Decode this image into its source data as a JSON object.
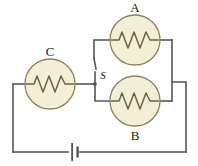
{
  "figure": {
    "kind": "circuit-diagram",
    "background_color": "#ffffff",
    "wire_color": "#555555",
    "lamp_fill_color": "#f3efd6",
    "lamp_stroke_color": "#8a8258",
    "filament_color": "#6b6340",
    "label_color": "#1a1a1a"
  },
  "components": {
    "lamp_a": {
      "label": "A",
      "symbol": "lamp-resistor-icon",
      "cx": 135,
      "cy": 40,
      "r": 25,
      "label_x": 135,
      "label_y": 12
    },
    "lamp_b": {
      "label": "B",
      "symbol": "lamp-resistor-icon",
      "cx": 135,
      "cy": 101,
      "r": 25,
      "label_x": 135,
      "label_y": 140
    },
    "lamp_c": {
      "label": "C",
      "symbol": "lamp-resistor-icon",
      "cx": 50,
      "cy": 84,
      "r": 25,
      "label_x": 50,
      "label_y": 56
    },
    "switch_s": {
      "label": "S",
      "symbol": "switch-icon",
      "label_x": 103,
      "label_y": 79,
      "node_x": 95,
      "node_y": 84,
      "top_y": 58
    },
    "battery": {
      "label": "",
      "symbol": "battery-cell-icon",
      "cx": 74,
      "cy": 152
    }
  },
  "wires": {
    "left_vertical": "from C left terminal down to bottom rail",
    "bottom_rail": "battery branch between left and right verticals",
    "right_outer_vertical": "right branch down to bottom rail",
    "a_branch": "top branch through lamp A",
    "b_branch": "lower branch through lamp B",
    "right_inner_vertical": "parallel junction joining A and B branches"
  }
}
